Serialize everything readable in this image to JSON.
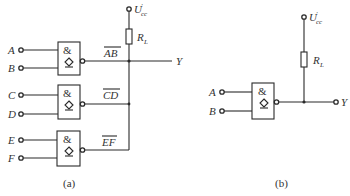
{
  "diagram_a": {
    "caption": "(a)",
    "inputs": [
      {
        "label": "A",
        "y": 50
      },
      {
        "label": "B",
        "y": 68
      },
      {
        "label": "C",
        "y": 95
      },
      {
        "label": "D",
        "y": 114
      },
      {
        "label": "E",
        "y": 140
      },
      {
        "label": "F",
        "y": 158
      }
    ],
    "gates": [
      {
        "symbol": "&",
        "output_label": "AB",
        "out_y": 61
      },
      {
        "symbol": "&",
        "output_label": "CD",
        "out_y": 104
      },
      {
        "symbol": "&",
        "output_label": "EF",
        "out_y": 150
      }
    ],
    "supply": {
      "label": "U",
      "prime": "′",
      "sub": "cc"
    },
    "resistor": {
      "label": "R",
      "sub": "L"
    },
    "output": {
      "label": "Y"
    }
  },
  "diagram_b": {
    "caption": "(b)",
    "inputs": [
      {
        "label": "A"
      },
      {
        "label": "B"
      }
    ],
    "gate": {
      "symbol": "&"
    },
    "supply": {
      "label": "U",
      "prime": "′",
      "sub": "cc"
    },
    "resistor": {
      "label": "R",
      "sub": "L"
    },
    "output": {
      "label": "Y"
    }
  },
  "colors": {
    "line": "#2a2a2a",
    "text": "#333333",
    "background": "#ffffff"
  }
}
